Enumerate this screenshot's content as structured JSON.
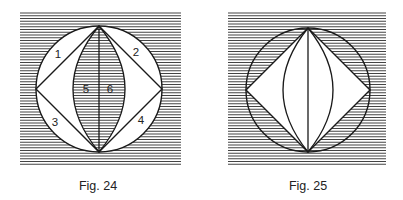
{
  "figures": [
    {
      "caption": "Fig. 24",
      "hatch_box": {
        "x": 20,
        "y": 13,
        "w": 161,
        "h": 152
      },
      "circle": {
        "cx": 99,
        "cy": 89,
        "r": 63
      },
      "lens_half_width": 26,
      "labels": [
        {
          "text": "1",
          "x": 58,
          "y": 58
        },
        {
          "text": "2",
          "x": 136,
          "y": 56
        },
        {
          "text": "3",
          "x": 55,
          "y": 126
        },
        {
          "text": "4",
          "x": 141,
          "y": 124
        },
        {
          "text": "5",
          "x": 86,
          "y": 93
        },
        {
          "text": "6",
          "x": 110,
          "y": 93
        }
      ]
    },
    {
      "caption": "Fig. 25",
      "hatch_box": {
        "x": 228,
        "y": 13,
        "w": 158,
        "h": 153
      },
      "circle": {
        "cx": 308,
        "cy": 90,
        "r": 62
      },
      "lens_half_width": 25,
      "labels": []
    }
  ],
  "colors": {
    "line": "#1a1a1a",
    "hatch": "#444444",
    "background": "#ffffff"
  }
}
